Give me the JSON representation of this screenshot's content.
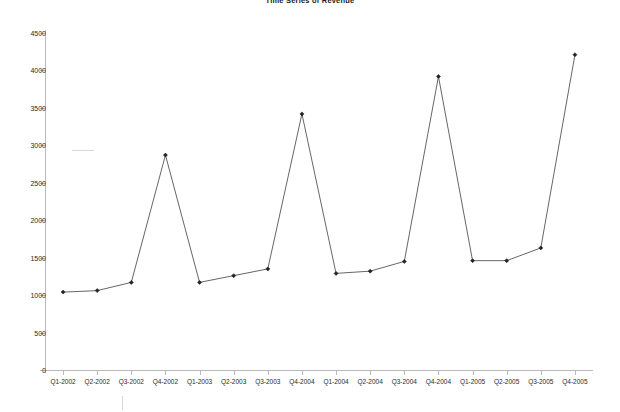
{
  "chart_data": {
    "type": "line",
    "title": "Time Series of Revenue",
    "xlabel": "",
    "ylabel": "",
    "ylim": [
      0,
      4500
    ],
    "ytick_step": 500,
    "yticks": [
      0,
      500,
      1000,
      1500,
      2000,
      2500,
      3000,
      3500,
      4000,
      4500
    ],
    "grid": false,
    "legend": null,
    "marker": "filled-diamond",
    "line_color": "#555555",
    "marker_color": "#222222",
    "categories": [
      "Q1-2002",
      "Q2-2002",
      "Q3-2002",
      "Q4-2002",
      "Q1-2003",
      "Q2-2003",
      "Q3-2003",
      "Q4-2004",
      "Q1-2004",
      "Q2-2004",
      "Q3-2004",
      "Q4-2004",
      "Q1-2005",
      "Q2-2005",
      "Q3-2005",
      "Q4-2005"
    ],
    "values": [
      1040,
      1060,
      1170,
      2870,
      1170,
      1260,
      1350,
      3420,
      1290,
      1320,
      1450,
      3920,
      1460,
      1460,
      1630,
      4210
    ]
  },
  "colors": {
    "background": "#ffffff",
    "axis": "#b9b9b9",
    "text": "#2b2b2b",
    "line": "#555555",
    "marker": "#222222"
  }
}
